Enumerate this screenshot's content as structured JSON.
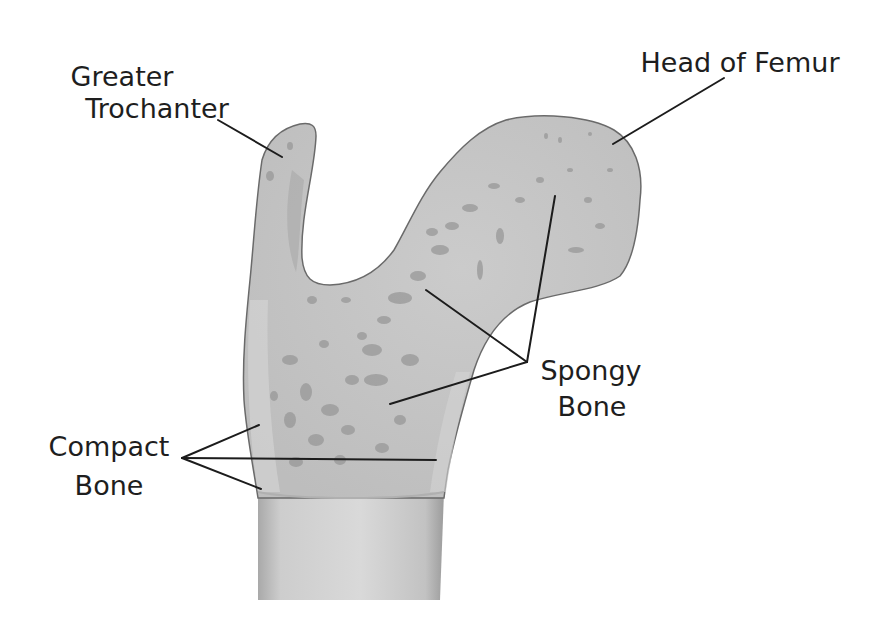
{
  "diagram": {
    "colors": {
      "background": "#ffffff",
      "bone_fill": "#c4c4c4",
      "bone_outline": "#6a6a6a",
      "pore": "#9a9a9a",
      "shaft_fill": "#cfcfcf",
      "label_text": "#1e1e1e",
      "leader_line": "#1c1c1c"
    },
    "labels": [
      {
        "id": "greater-trochanter",
        "lines": [
          "Greater",
          "Trochanter"
        ]
      },
      {
        "id": "head-of-femur",
        "lines": [
          "Head of Femur"
        ]
      },
      {
        "id": "spongy-bone",
        "lines": [
          "Spongy",
          "Bone"
        ]
      },
      {
        "id": "compact-bone",
        "lines": [
          "Compact",
          "Bone"
        ]
      }
    ]
  }
}
